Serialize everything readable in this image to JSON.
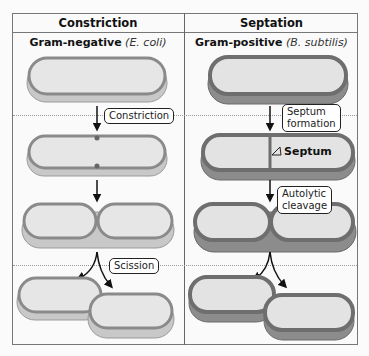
{
  "columns": [
    {
      "header": "Constriction",
      "subtitle_bold": "Gram-negative",
      "subtitle_italic": "(E. coli)"
    },
    {
      "header": "Septation",
      "subtitle_bold": "Gram-positive",
      "subtitle_italic": "(B. subtilis)"
    }
  ],
  "labels": {
    "constriction": "Constriction",
    "scission": "Scission",
    "septum_formation_1": "Septum",
    "septum_formation_2": "formation",
    "septum": "Septum",
    "autolytic_1": "Autolytic",
    "autolytic_2": "cleavage"
  },
  "colors": {
    "border": "#777777",
    "cell_fill": "#e4e4e4",
    "wall_gram_negative": "#8a8a8a",
    "wall_gram_positive": "#6e6e6e"
  }
}
